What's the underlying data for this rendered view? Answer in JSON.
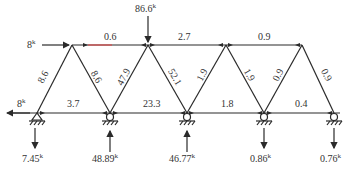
{
  "diagram": {
    "type": "truss-member-forces",
    "colors": {
      "line": "#2a2a2a",
      "text": "#333333",
      "highlight": "#d84a4a"
    },
    "loads": {
      "top_vertical": {
        "value": "86.6",
        "unit": "k"
      },
      "top_horizontal": {
        "value": "8",
        "unit": "k"
      },
      "bottom_horizontal": {
        "value": "8",
        "unit": "k"
      }
    },
    "top_chord": [
      {
        "label": "0.6"
      },
      {
        "label": "2.7"
      },
      {
        "label": "0.9"
      }
    ],
    "bottom_chord": [
      {
        "label": "3.7"
      },
      {
        "label": "23.3"
      },
      {
        "label": "1.8"
      },
      {
        "label": "0.4"
      }
    ],
    "diagonals": [
      {
        "label": "8.6"
      },
      {
        "label": "8.6"
      },
      {
        "label": "47.9"
      },
      {
        "label": "52.1"
      },
      {
        "label": "1.9"
      },
      {
        "label": "1.9"
      },
      {
        "label": "0.9"
      },
      {
        "label": "0.9"
      }
    ],
    "reactions": [
      {
        "value": "7.45",
        "unit": "k"
      },
      {
        "value": "48.89",
        "unit": "k"
      },
      {
        "value": "46.77",
        "unit": "k"
      },
      {
        "value": "0.86",
        "unit": "k"
      },
      {
        "value": "0.76",
        "unit": "k"
      }
    ]
  }
}
